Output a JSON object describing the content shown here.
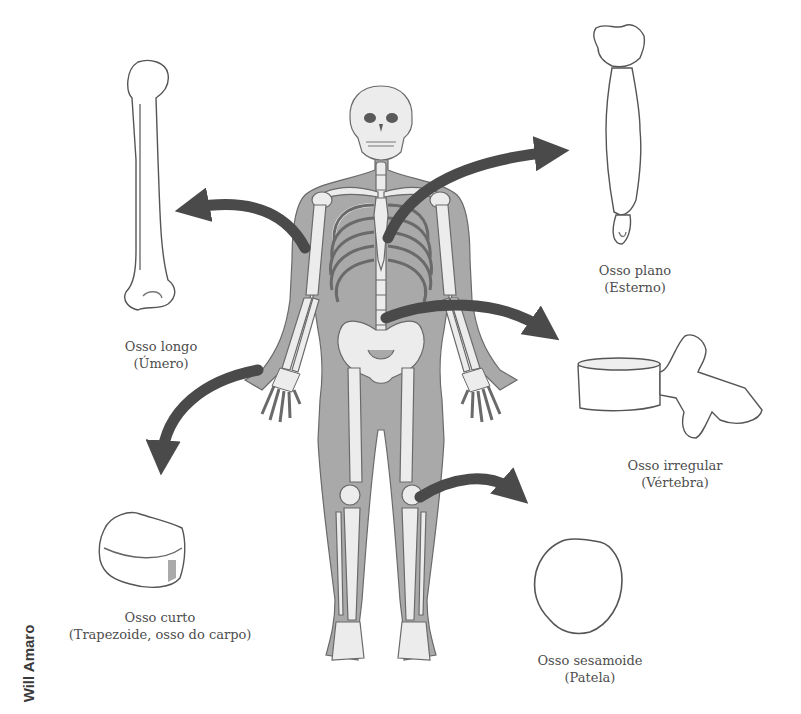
{
  "figure": {
    "credit": "Will Amaro",
    "colors": {
      "body_fill": "#a9a9a9",
      "bone_fill": "#ececec",
      "outline": "#5a5a5a",
      "arrow": "#4a4a4a",
      "text": "#4d4d4d"
    }
  },
  "labels": [
    {
      "id": "long",
      "name": "Osso longo",
      "example": "(Úmero)"
    },
    {
      "id": "flat",
      "name": "Osso plano",
      "example": "(Esterno)"
    },
    {
      "id": "irregular",
      "name": "Osso irregular",
      "example": "(Vértebra)"
    },
    {
      "id": "short",
      "name": "Osso curto",
      "example": "(Trapezoide, osso do carpo)"
    },
    {
      "id": "sesamoid",
      "name": "Osso sesamoide",
      "example": "(Patela)"
    }
  ]
}
